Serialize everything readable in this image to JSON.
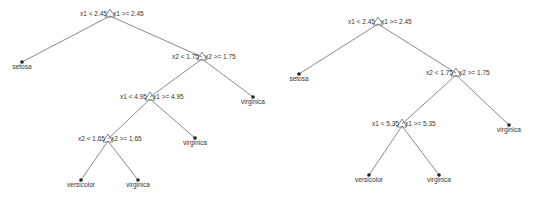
{
  "colors": {
    "background": "#ffffff",
    "edge": "#8a8a8a",
    "text": "#333333",
    "leaf": "#222222"
  },
  "trees": [
    {
      "name": "left-tree",
      "nodes": [
        {
          "id": "n1",
          "type": "split",
          "x": 110,
          "y": 14,
          "left_label": "x1 < 2.45",
          "right_label": "x1 >= 2.45"
        },
        {
          "id": "n2",
          "type": "leaf",
          "x": 22,
          "y": 62,
          "label": "setosa"
        },
        {
          "id": "n3",
          "type": "split",
          "x": 202,
          "y": 57,
          "left_label": "x2 < 1.75",
          "right_label": "x2 >= 1.75"
        },
        {
          "id": "n4",
          "type": "split",
          "x": 150,
          "y": 97,
          "left_label": "x1 < 4.95",
          "right_label": "x1 >= 4.95"
        },
        {
          "id": "n5",
          "type": "leaf",
          "x": 253,
          "y": 97,
          "label": "virginica"
        },
        {
          "id": "n6",
          "type": "split",
          "x": 108,
          "y": 139,
          "left_label": "x2 < 1.65",
          "right_label": "x2 >= 1.65"
        },
        {
          "id": "n7",
          "type": "leaf",
          "x": 195,
          "y": 138,
          "label": "virginica"
        },
        {
          "id": "n8",
          "type": "leaf",
          "x": 81,
          "y": 180,
          "label": "versicolor"
        },
        {
          "id": "n9",
          "type": "leaf",
          "x": 138,
          "y": 180,
          "label": "virginica"
        }
      ],
      "edges": [
        [
          "n1",
          "n2"
        ],
        [
          "n1",
          "n3"
        ],
        [
          "n3",
          "n4"
        ],
        [
          "n3",
          "n5"
        ],
        [
          "n4",
          "n6"
        ],
        [
          "n4",
          "n7"
        ],
        [
          "n6",
          "n8"
        ],
        [
          "n6",
          "n9"
        ]
      ]
    },
    {
      "name": "right-tree",
      "nodes": [
        {
          "id": "m1",
          "type": "split",
          "x": 378,
          "y": 22,
          "left_label": "x1 < 2.45",
          "right_label": "x1 >= 2.45"
        },
        {
          "id": "m2",
          "type": "leaf",
          "x": 299,
          "y": 74,
          "label": "setosa"
        },
        {
          "id": "m3",
          "type": "split",
          "x": 456,
          "y": 73,
          "left_label": "x2 < 1.75",
          "right_label": "x2 >= 1.75"
        },
        {
          "id": "m4",
          "type": "split",
          "x": 402,
          "y": 124,
          "left_label": "x1 < 5.35",
          "right_label": "x1 >= 5.35"
        },
        {
          "id": "m5",
          "type": "leaf",
          "x": 509,
          "y": 125,
          "label": "virginica"
        },
        {
          "id": "m6",
          "type": "leaf",
          "x": 369,
          "y": 175,
          "label": "versicolor"
        },
        {
          "id": "m7",
          "type": "leaf",
          "x": 439,
          "y": 175,
          "label": "virginica"
        }
      ],
      "edges": [
        [
          "m1",
          "m2"
        ],
        [
          "m1",
          "m3"
        ],
        [
          "m3",
          "m4"
        ],
        [
          "m3",
          "m5"
        ],
        [
          "m4",
          "m6"
        ],
        [
          "m4",
          "m7"
        ]
      ]
    }
  ]
}
